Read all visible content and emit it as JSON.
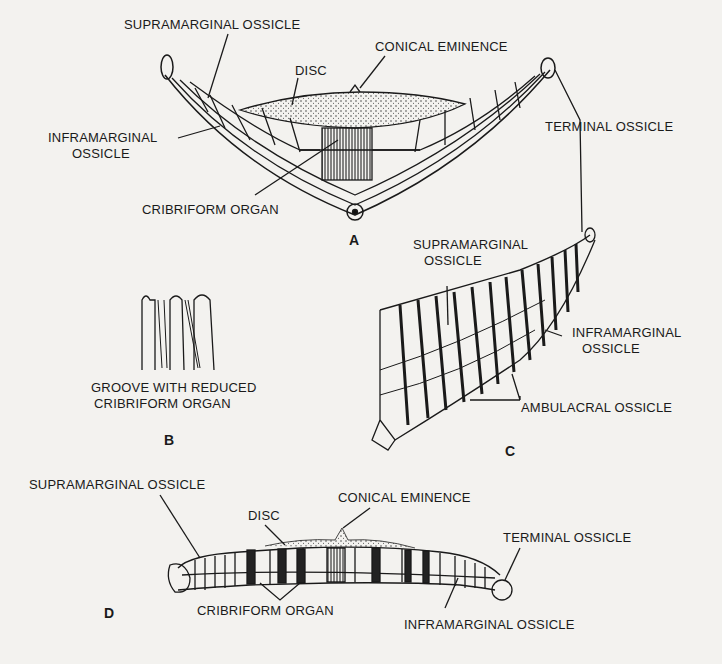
{
  "figures": {
    "A": {
      "letter": "A",
      "labels": {
        "supramarginal": "SUPRAMARGINAL OSSICLE",
        "conical": "CONICAL EMINENCE",
        "disc": "DISC",
        "inframarginal_1": "INFRAMARGINAL",
        "inframarginal_2": "OSSICLE",
        "terminal": "TERMINAL OSSICLE",
        "cribriform": "CRIBRIFORM ORGAN"
      }
    },
    "B": {
      "letter": "B",
      "labels": {
        "line1": "GROOVE WITH REDUCED",
        "line2": "CRIBRIFORM ORGAN"
      }
    },
    "C": {
      "letter": "C",
      "labels": {
        "supramarginal_1": "SUPRAMARGINAL",
        "supramarginal_2": "OSSICLE",
        "inframarginal_1": "INFRAMARGINAL",
        "inframarginal_2": "OSSICLE",
        "ambulacral": "AMBULACRAL OSSICLE"
      }
    },
    "D": {
      "letter": "D",
      "labels": {
        "supramarginal": "SUPRAMARGINAL OSSICLE",
        "conical": "CONICAL EMINENCE",
        "disc": "DISC",
        "terminal": "TERMINAL OSSICLE",
        "cribriform": "CRIBRIFORM ORGAN",
        "inframarginal": "INFRAMARGINAL OSSICLE"
      }
    }
  }
}
